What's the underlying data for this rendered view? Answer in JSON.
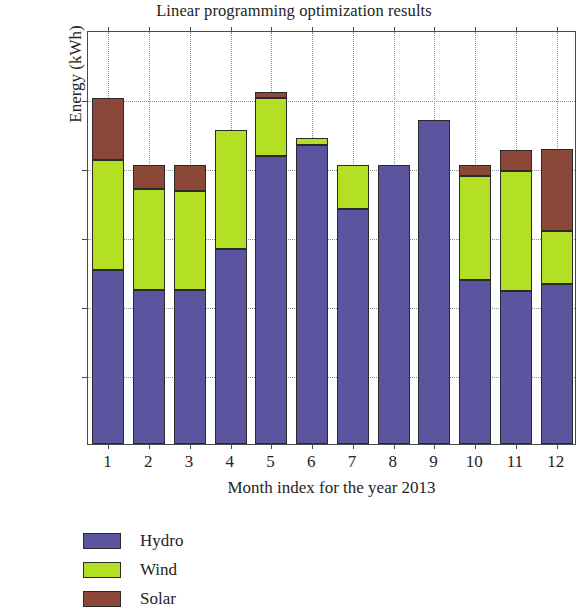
{
  "chart_data": {
    "type": "bar",
    "subtype": "stacked-bar",
    "title": "Linear programming optimization results",
    "xlabel": "Month index for the year 2013",
    "ylabel": "Energy (kWh)",
    "categories": [
      "1",
      "2",
      "3",
      "4",
      "5",
      "6",
      "7",
      "8",
      "9",
      "10",
      "11",
      "12"
    ],
    "series": [
      {
        "name": "Hydro",
        "color": "#5b55a0",
        "values": [
          2520,
          2230,
          2230,
          2820,
          4180,
          4330,
          3400,
          4050,
          4690,
          2380,
          2220,
          2320
        ]
      },
      {
        "name": "Wind",
        "color": "#b3e024",
        "values": [
          1590,
          1460,
          1440,
          1730,
          830,
          100,
          650,
          0,
          0,
          1500,
          1740,
          760
        ]
      },
      {
        "name": "Solar",
        "color": "#8b4838",
        "values": [
          900,
          360,
          380,
          0,
          90,
          0,
          0,
          0,
          0,
          170,
          300,
          1190
        ]
      }
    ],
    "totals": [
      5010,
      4050,
      4050,
      4550,
      5100,
      4430,
      4050,
      4050,
      4690,
      4050,
      4260,
      4270
    ],
    "ylim": [
      0,
      6000
    ],
    "yticks": [
      0,
      1000,
      2000,
      3000,
      4000,
      5000,
      6000
    ],
    "ytick_labels": [
      "0",
      "1000",
      "2000",
      "3000",
      "4000",
      "5000",
      "6000"
    ],
    "grid": true,
    "grid_style": "dotted",
    "legend_position": "below-left",
    "legend_entries": [
      "Hydro",
      "Wind",
      "Solar"
    ]
  },
  "colors": {
    "hydro": "#5b55a0",
    "wind": "#b3e024",
    "solar": "#8b4838",
    "axis": "#4a4a4a",
    "grid": "#8e8e8e",
    "text": "#242424",
    "background": "#ffffff"
  }
}
